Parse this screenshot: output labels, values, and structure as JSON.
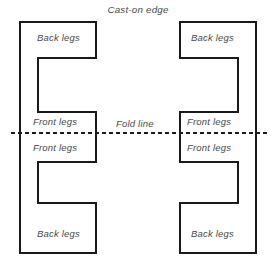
{
  "diagram": {
    "title": "Cast-on edge",
    "fold_line_label": "Fold line",
    "stroke_color": "#1a1a1a",
    "text_color": "#4a4a4a",
    "background_color": "#ffffff",
    "labels": {
      "back_top_left": "Back legs",
      "back_top_right": "Back legs",
      "front_top_left": "Front legs",
      "front_top_right": "Front legs",
      "front_bottom_left": "Front legs",
      "front_bottom_right": "Front legs",
      "back_bottom_left": "Back legs",
      "back_bottom_right": "Back legs"
    },
    "shapes": {
      "left_bracket_path": "M 20,22 L 96,22 L 96,58 L 20,58 Z",
      "right_bracket_path": "M 180,22 L 256,22 L 256,58 L 180,58 Z"
    },
    "fold_line": {
      "y": 133,
      "x_start": 11,
      "x_end": 268,
      "style": "dashed"
    }
  }
}
